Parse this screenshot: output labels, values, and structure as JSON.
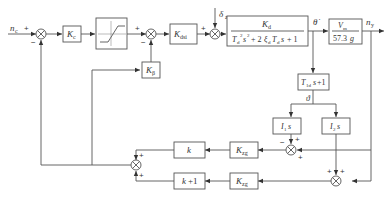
{
  "diagram": {
    "type": "control-block-diagram",
    "signals": {
      "input": "n_c",
      "theta_dot": "θ̇",
      "theta": "ϑ",
      "delta_z": "δ_z",
      "output": "n_y"
    },
    "blocks": {
      "k_c": {
        "main": "K",
        "sub": "c"
      },
      "limiter": {
        "label": "saturation"
      },
      "k_dsi": {
        "main": "K",
        "sub": "dsi"
      },
      "k_beta": {
        "main": "K",
        "sub": "β"
      },
      "plant": {
        "numerator_main": "K",
        "numerator_sub": "d",
        "denominator": "T_d²s² + 2ξ_d T_d s + 1"
      },
      "gain_out": {
        "numerator": "V_m",
        "denominator": "57.3g"
      },
      "t1d": {
        "label": "T_1d s+1"
      },
      "i1s": {
        "label": "I_1 s"
      },
      "i2s": {
        "label": "I_2 s"
      },
      "k_zg_1": {
        "main": "K",
        "sub": "zg"
      },
      "k_zg_2": {
        "main": "K",
        "sub": "zg"
      },
      "k": {
        "label": "k"
      },
      "k_plus_1": {
        "label": "k+1"
      }
    },
    "signs": {
      "sum1": [
        "+",
        "−"
      ],
      "sum2": [
        "+",
        "−"
      ],
      "sum3": [
        "+"
      ],
      "sum4": [
        "−",
        "+",
        "+"
      ],
      "sum5": [
        "+",
        "+"
      ],
      "sum6": [
        "+",
        "+"
      ]
    }
  }
}
